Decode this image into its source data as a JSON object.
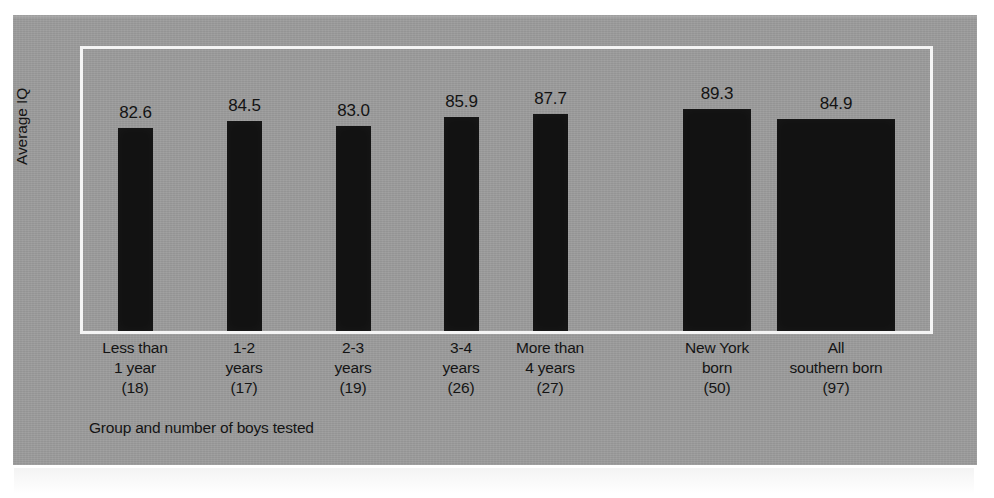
{
  "figure": {
    "axis_title_y": "Average IQ",
    "caption": "Group and number of boys tested"
  },
  "chart_data": {
    "type": "bar",
    "title": "",
    "subtitle": "",
    "xlabel": "Group and number of boys tested",
    "ylabel": "Average IQ",
    "grid": false,
    "legend": "none",
    "ylim": [
      75,
      92
    ],
    "value_label_format": "one-decimal",
    "categories": [
      "Less than 1 year (18)",
      "1-2 years (17)",
      "2-3 years (19)",
      "3-4 years (26)",
      "More than 4 years (27)",
      "New York born (50)",
      "All southern born (97)"
    ],
    "values": [
      82.6,
      84.5,
      83.0,
      85.9,
      87.7,
      89.3,
      84.9
    ],
    "sample_sizes": [
      18,
      17,
      19,
      26,
      27,
      50,
      97
    ],
    "bars": [
      {
        "label_lines": [
          "Less than",
          "1 year",
          "(18)"
        ],
        "value": 82.6,
        "value_text": "82.6",
        "n_text": "(18)",
        "left": 38,
        "width": 35,
        "height": 203
      },
      {
        "label_lines": [
          "1-2",
          "years",
          "(17)"
        ],
        "value": 84.5,
        "value_text": "84.5",
        "n_text": "(17)",
        "left": 147,
        "width": 35,
        "height": 210
      },
      {
        "label_lines": [
          "2-3",
          "years",
          "(19)"
        ],
        "value": 83.0,
        "value_text": "83.0",
        "n_text": "(19)",
        "left": 256,
        "width": 35,
        "height": 205
      },
      {
        "label_lines": [
          "3-4",
          "years",
          "(26)"
        ],
        "value": 85.9,
        "value_text": "85.9",
        "n_text": "(26)",
        "left": 364,
        "width": 35,
        "height": 214
      },
      {
        "label_lines": [
          "More than",
          "4 years",
          "(27)"
        ],
        "value": 87.7,
        "value_text": "87.7",
        "n_text": "(27)",
        "left": 453,
        "width": 35,
        "height": 217
      },
      {
        "label_lines": [
          "New York",
          "born",
          "(50)"
        ],
        "value": 89.3,
        "value_text": "89.3",
        "n_text": "(50)",
        "left": 603,
        "width": 68,
        "height": 222
      },
      {
        "label_lines": [
          "All",
          "southern born",
          "(97)"
        ],
        "value": 84.9,
        "value_text": "84.9",
        "n_text": "(97)",
        "left": 697,
        "width": 118,
        "height": 212
      }
    ],
    "label_centers": [
      55,
      164,
      273,
      381,
      470,
      637,
      756
    ],
    "colors": {
      "bar": "#121212",
      "panel_background": "#9c9c9c",
      "frame": "#f4f4f4",
      "text": "#141414",
      "page_background": "#ffffff"
    }
  }
}
